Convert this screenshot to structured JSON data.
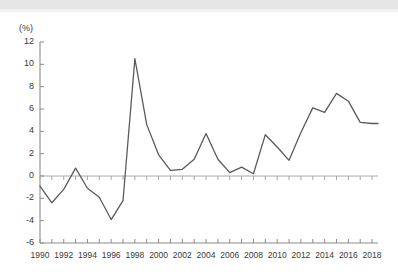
{
  "figure": {
    "unit_label": "(%)",
    "line_color": "#5a5a5a",
    "axis_color": "#8c8c8c",
    "text_color": "#3a3a3a",
    "background": "#ffffff"
  },
  "chart_data": {
    "type": "line",
    "title": "",
    "subtitle": "",
    "xlabel": "",
    "ylabel": "(%)",
    "grid": false,
    "legend": "none",
    "xlim": [
      1990,
      2018.5
    ],
    "ylim": [
      -6,
      12
    ],
    "ytick_step": 2,
    "xtick_step_minor": 1,
    "xtick_step_major": 2,
    "ytick_labels": [
      "12",
      "10",
      "8",
      "6",
      "4",
      "2",
      "0",
      "-2",
      "-4",
      "-6"
    ],
    "ytick_values": [
      12,
      10,
      8,
      6,
      4,
      2,
      0,
      -2,
      -4,
      -6
    ],
    "xtick_labels": [
      "1990",
      "1992",
      "1994",
      "1996",
      "1998",
      "2000",
      "2002",
      "2004",
      "2006",
      "2008",
      "2010",
      "2012",
      "2014",
      "2016",
      "2018"
    ],
    "xtick_values": [
      1990,
      1992,
      1994,
      1996,
      1998,
      2000,
      2002,
      2004,
      2006,
      2008,
      2010,
      2012,
      2014,
      2016,
      2018
    ],
    "zero_line": 0,
    "series": [
      {
        "name": "rate",
        "x": [
          1990,
          1991,
          1992,
          1993,
          1994,
          1995,
          1996,
          1997,
          1998,
          1999,
          2000,
          2001,
          2002,
          2003,
          2004,
          2005,
          2006,
          2007,
          2008,
          2009,
          2010,
          2011,
          2012,
          2013,
          2014,
          2015,
          2016,
          2017,
          2018,
          2018.5
        ],
        "values": [
          -0.9,
          -2.4,
          -1.2,
          0.7,
          -1.1,
          -1.9,
          -3.9,
          -2.2,
          10.5,
          4.6,
          1.9,
          0.5,
          0.6,
          1.5,
          3.8,
          1.5,
          0.3,
          0.8,
          0.2,
          3.7,
          2.6,
          1.4,
          3.9,
          6.1,
          5.7,
          7.4,
          6.7,
          4.8,
          4.7,
          4.7
        ]
      }
    ]
  }
}
